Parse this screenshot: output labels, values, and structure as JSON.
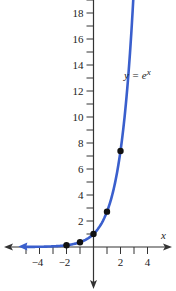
{
  "chart_data": {
    "type": "line",
    "title": "",
    "function_label": "y = e^x",
    "function_label_parts": {
      "lhs": "y = e",
      "exp": "x"
    },
    "xlabel": "x",
    "ylabel": "",
    "xlim": [
      -6.5,
      5.2
    ],
    "ylim": [
      -3,
      19.5
    ],
    "x_ticks": [
      -4,
      -2,
      2,
      4
    ],
    "x_minor_ticks": [
      -5,
      -4,
      -3,
      -2,
      -1,
      1,
      2,
      3,
      4
    ],
    "y_ticks": [
      2,
      4,
      6,
      8,
      10,
      12,
      14,
      16,
      18
    ],
    "y_minor_ticks": [
      1,
      2,
      3,
      4,
      5,
      6,
      7,
      8,
      9,
      10,
      11,
      12,
      13,
      14,
      15,
      16,
      17,
      18,
      19
    ],
    "grid": false,
    "series": [
      {
        "name": "y = e^x",
        "color": "#3a5fcd",
        "kind": "curve",
        "x_range": [
          -6.5,
          2.98
        ]
      }
    ],
    "points": [
      {
        "x": -2,
        "y": 0.135
      },
      {
        "x": -1,
        "y": 0.368
      },
      {
        "x": 0,
        "y": 1
      },
      {
        "x": 1,
        "y": 2.718
      },
      {
        "x": 2,
        "y": 7.389
      }
    ]
  },
  "style": {
    "curve_color": "#3a5fcd",
    "axis_color": "#333333",
    "point_color": "#111111"
  }
}
